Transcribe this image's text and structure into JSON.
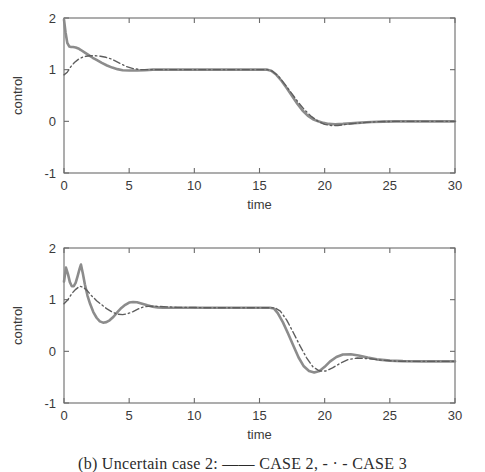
{
  "figure": {
    "caption": "(b) Uncertain case 2:  ——  CASE 2,  - · -  CASE 3"
  },
  "chart_data": [
    {
      "id": "panel-a",
      "type": "line",
      "title": "",
      "xlabel": "time",
      "ylabel": "control",
      "xlim": [
        0,
        30
      ],
      "ylim": [
        -1,
        2
      ],
      "xticks": [
        0,
        5,
        10,
        15,
        20,
        25,
        30
      ],
      "yticks": [
        2,
        1,
        0,
        -1
      ],
      "xticklabels": [
        "0",
        "5",
        "10",
        "15",
        "20",
        "25",
        "30"
      ],
      "yticklabels": [
        "2",
        "1",
        "0",
        "-1"
      ],
      "grid": false,
      "legend": "none",
      "series": [
        {
          "name": "CASE 2",
          "style": "solid",
          "color": "#8c8c8c",
          "width": 2.6,
          "x": [
            0.0,
            0.12,
            0.25,
            0.4,
            0.55,
            0.7,
            0.9,
            1.1,
            1.3,
            1.6,
            1.9,
            2.2,
            2.5,
            2.9,
            3.3,
            3.7,
            4.1,
            4.5,
            5.0,
            5.6,
            6.2,
            6.8,
            7.4,
            8.0,
            9.0,
            10.0,
            11.0,
            12.0,
            13.0,
            14.0,
            15.0,
            15.4,
            15.6,
            15.9,
            16.3,
            16.7,
            17.1,
            17.5,
            17.9,
            18.3,
            18.7,
            19.1,
            19.5,
            19.9,
            20.3,
            20.8,
            21.4,
            22.0,
            22.8,
            23.6,
            24.5,
            25.5,
            26.5,
            27.5,
            28.5,
            29.2,
            30.0
          ],
          "y": [
            1.97,
            1.72,
            1.52,
            1.45,
            1.44,
            1.44,
            1.43,
            1.41,
            1.38,
            1.33,
            1.28,
            1.23,
            1.19,
            1.13,
            1.08,
            1.04,
            1.01,
            0.99,
            0.985,
            0.985,
            0.99,
            1.0,
            1.0,
            1.0,
            1.0,
            1.0,
            1.0,
            1.0,
            1.0,
            1.0,
            1.0,
            1.0,
            1.0,
            0.98,
            0.9,
            0.78,
            0.64,
            0.49,
            0.34,
            0.21,
            0.11,
            0.04,
            0.0,
            -0.03,
            -0.05,
            -0.055,
            -0.05,
            -0.04,
            -0.025,
            -0.012,
            -0.005,
            0.0,
            0.0,
            0.0,
            0.0,
            0.0,
            0.0
          ]
        },
        {
          "name": "CASE 3",
          "style": "dashdot",
          "color": "#5e5e5e",
          "width": 1.4,
          "x": [
            0.0,
            0.25,
            0.5,
            0.8,
            1.1,
            1.4,
            1.7,
            2.0,
            2.4,
            2.8,
            3.2,
            3.6,
            4.0,
            4.4,
            4.8,
            5.3,
            5.9,
            6.5,
            7.2,
            8.0,
            9.0,
            10.0,
            11.5,
            13.0,
            14.5,
            15.2,
            15.6,
            16.0,
            16.5,
            17.0,
            17.5,
            18.0,
            18.5,
            19.0,
            19.5,
            20.0,
            20.5,
            21.0,
            21.6,
            22.3,
            23.2,
            24.2,
            25.5,
            27.0,
            28.5,
            30.0
          ],
          "y": [
            0.9,
            0.95,
            1.05,
            1.14,
            1.2,
            1.24,
            1.26,
            1.27,
            1.27,
            1.26,
            1.24,
            1.21,
            1.16,
            1.11,
            1.06,
            1.02,
            1.0,
            1.0,
            1.0,
            1.0,
            1.0,
            1.0,
            1.0,
            1.0,
            1.0,
            1.0,
            1.0,
            0.97,
            0.86,
            0.7,
            0.53,
            0.36,
            0.21,
            0.09,
            0.0,
            -0.06,
            -0.08,
            -0.08,
            -0.06,
            -0.04,
            -0.02,
            -0.005,
            0.0,
            0.0,
            0.0,
            0.0
          ]
        }
      ]
    },
    {
      "id": "panel-b",
      "type": "line",
      "title": "",
      "xlabel": "time",
      "ylabel": "control",
      "xlim": [
        0,
        30
      ],
      "ylim": [
        -1,
        2
      ],
      "xticks": [
        0,
        5,
        10,
        15,
        20,
        25,
        30
      ],
      "yticks": [
        2,
        1,
        0,
        -1
      ],
      "xticklabels": [
        "0",
        "5",
        "10",
        "15",
        "20",
        "25",
        "30"
      ],
      "yticklabels": [
        "2",
        "1",
        "0",
        "-1"
      ],
      "grid": false,
      "legend": "none",
      "series": [
        {
          "name": "CASE 2",
          "style": "solid",
          "color": "#8c8c8c",
          "width": 2.6,
          "x": [
            0.0,
            0.15,
            0.3,
            0.45,
            0.6,
            0.75,
            0.9,
            1.05,
            1.2,
            1.3,
            1.45,
            1.6,
            1.8,
            2.0,
            2.25,
            2.5,
            2.75,
            3.0,
            3.25,
            3.5,
            3.8,
            4.1,
            4.4,
            4.7,
            5.0,
            5.3,
            5.6,
            6.0,
            6.4,
            6.8,
            7.2,
            7.6,
            8.0,
            8.6,
            9.3,
            10.0,
            11.0,
            12.0,
            13.0,
            14.0,
            15.0,
            15.8,
            16.1,
            16.4,
            16.8,
            17.2,
            17.6,
            18.0,
            18.4,
            18.8,
            19.2,
            19.6,
            20.0,
            20.4,
            20.9,
            21.4,
            22.0,
            22.6,
            23.3,
            24.0,
            25.0,
            26.0,
            27.5,
            29.0,
            30.0
          ],
          "y": [
            1.35,
            1.62,
            1.5,
            1.34,
            1.26,
            1.26,
            1.33,
            1.46,
            1.6,
            1.68,
            1.5,
            1.3,
            1.08,
            0.92,
            0.76,
            0.65,
            0.58,
            0.555,
            0.565,
            0.6,
            0.67,
            0.76,
            0.84,
            0.9,
            0.945,
            0.955,
            0.95,
            0.92,
            0.89,
            0.865,
            0.85,
            0.845,
            0.845,
            0.845,
            0.845,
            0.845,
            0.845,
            0.845,
            0.845,
            0.845,
            0.845,
            0.845,
            0.83,
            0.74,
            0.56,
            0.34,
            0.11,
            -0.12,
            -0.29,
            -0.38,
            -0.41,
            -0.38,
            -0.3,
            -0.2,
            -0.11,
            -0.06,
            -0.055,
            -0.08,
            -0.12,
            -0.155,
            -0.18,
            -0.19,
            -0.195,
            -0.195,
            -0.195
          ]
        },
        {
          "name": "CASE 3",
          "style": "dashdot",
          "color": "#5e5e5e",
          "width": 1.4,
          "x": [
            0.0,
            0.3,
            0.6,
            0.9,
            1.2,
            1.5,
            1.8,
            2.1,
            2.5,
            2.9,
            3.3,
            3.7,
            4.1,
            4.5,
            4.9,
            5.3,
            5.7,
            6.1,
            6.6,
            7.2,
            7.9,
            8.7,
            9.6,
            10.6,
            12.0,
            13.5,
            15.0,
            15.8,
            16.2,
            16.6,
            17.1,
            17.6,
            18.1,
            18.6,
            19.1,
            19.6,
            20.1,
            20.6,
            21.2,
            21.8,
            22.5,
            23.3,
            24.3,
            25.5,
            27.0,
            28.5,
            30.0
          ],
          "y": [
            0.92,
            1.0,
            1.12,
            1.2,
            1.26,
            1.24,
            1.17,
            1.08,
            0.98,
            0.9,
            0.82,
            0.76,
            0.72,
            0.71,
            0.73,
            0.77,
            0.82,
            0.86,
            0.875,
            0.87,
            0.86,
            0.85,
            0.85,
            0.845,
            0.845,
            0.845,
            0.845,
            0.845,
            0.84,
            0.78,
            0.6,
            0.36,
            0.11,
            -0.12,
            -0.3,
            -0.38,
            -0.38,
            -0.32,
            -0.23,
            -0.16,
            -0.13,
            -0.14,
            -0.17,
            -0.19,
            -0.195,
            -0.195,
            -0.195
          ]
        }
      ]
    }
  ]
}
